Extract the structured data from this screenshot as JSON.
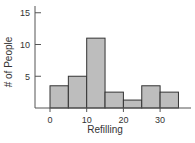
{
  "chart_data": {
    "type": "bar",
    "subtype": "histogram",
    "title": "",
    "xlabel": "Refilling",
    "ylabel": "# of People",
    "bin_width": 5,
    "bins": [
      {
        "start": 0,
        "end": 5,
        "count": 3.5
      },
      {
        "start": 5,
        "end": 10,
        "count": 5
      },
      {
        "start": 10,
        "end": 15,
        "count": 11
      },
      {
        "start": 15,
        "end": 20,
        "count": 2.5
      },
      {
        "start": 20,
        "end": 25,
        "count": 1.25
      },
      {
        "start": 25,
        "end": 30,
        "count": 3.5
      },
      {
        "start": 30,
        "end": 35,
        "count": 2.5
      }
    ],
    "xticks": [
      0,
      10,
      20,
      30
    ],
    "yticks": [
      5,
      10,
      15
    ],
    "xlim": [
      -4,
      39
    ],
    "ylim": [
      0,
      16
    ],
    "grid": false,
    "legend": null,
    "colors": {
      "bar_fill": "#bdbdbd",
      "bar_edge": "#333333",
      "axis": "#555555"
    }
  }
}
